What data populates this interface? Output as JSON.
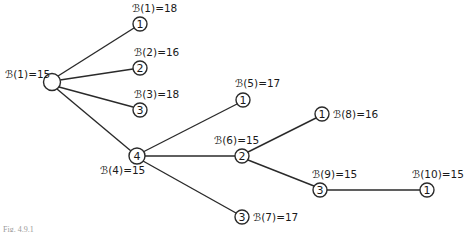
{
  "diagram": {
    "type": "tree",
    "root": {
      "id": "root",
      "label": "",
      "bound_label": "ℬ(1)=15"
    },
    "nodes": [
      {
        "id": "n1",
        "label": "1",
        "bound_label": "ℬ(1)=18",
        "parent": "root"
      },
      {
        "id": "n2",
        "label": "2",
        "bound_label": "ℬ(2)=16",
        "parent": "root"
      },
      {
        "id": "n3",
        "label": "3",
        "bound_label": "ℬ(3)=18",
        "parent": "root"
      },
      {
        "id": "n4",
        "label": "4",
        "bound_label": "ℬ(4)=15",
        "parent": "root"
      },
      {
        "id": "n5",
        "label": "1",
        "bound_label": "ℬ(5)=17",
        "parent": "n4"
      },
      {
        "id": "n6",
        "label": "2",
        "bound_label": "ℬ(6)=15",
        "parent": "n4"
      },
      {
        "id": "n7",
        "label": "3",
        "bound_label": "ℬ(7)=17",
        "parent": "n4"
      },
      {
        "id": "n8",
        "label": "1",
        "bound_label": "ℬ(8)=16",
        "parent": "n6"
      },
      {
        "id": "n9",
        "label": "3",
        "bound_label": "ℬ(9)=15",
        "parent": "n6"
      },
      {
        "id": "n10",
        "label": "1",
        "bound_label": "ℬ(10)=15",
        "parent": "n9"
      }
    ],
    "caption": "Fig. 4.9.1"
  }
}
